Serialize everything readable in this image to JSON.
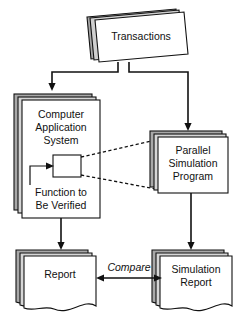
{
  "diagram": {
    "colors": {
      "stack_shadow": "#a8a8a8",
      "panel_fill": "#ffffff",
      "outline": "#111111",
      "background": "#ffffff"
    },
    "nodes": [
      {
        "id": "transactions",
        "label": "Transactions",
        "shape": "skewed-card-stack",
        "name": "node-transactions"
      },
      {
        "id": "computer-application-system",
        "label_lines": [
          "Computer",
          "Application",
          "System"
        ],
        "shape": "stacked-rectangle",
        "name": "node-computer-application-system"
      },
      {
        "id": "function-to-be-verified",
        "label_lines": [
          "Function to",
          "Be Verified"
        ],
        "shape": "inner-rectangle",
        "name": "node-function-to-be-verified"
      },
      {
        "id": "parallel-simulation-program",
        "label_lines": [
          "Parallel",
          "Simulation",
          "Program"
        ],
        "shape": "stacked-rectangle",
        "name": "node-parallel-simulation-program"
      },
      {
        "id": "report",
        "label_lines": [
          "Report"
        ],
        "shape": "document-stack",
        "name": "node-report"
      },
      {
        "id": "simulation-report",
        "label_lines": [
          "Simulation",
          "Report"
        ],
        "shape": "document-stack",
        "name": "node-simulation-report"
      }
    ],
    "edges": [
      {
        "from": "transactions",
        "to": "computer-application-system",
        "style": "solid-arrow",
        "label": ""
      },
      {
        "from": "transactions",
        "to": "parallel-simulation-program",
        "style": "solid-arrow",
        "label": ""
      },
      {
        "from": "function-to-be-verified",
        "to": "parallel-simulation-program",
        "style": "dashed",
        "label": ""
      },
      {
        "from": "computer-application-system",
        "to": "report",
        "style": "solid-arrow",
        "label": ""
      },
      {
        "from": "parallel-simulation-program",
        "to": "simulation-report",
        "style": "solid-arrow",
        "label": ""
      },
      {
        "from": "report",
        "to": "simulation-report",
        "style": "double-arrow",
        "label": "Compare"
      }
    ],
    "edge_labels": {
      "compare": "Compare"
    }
  }
}
